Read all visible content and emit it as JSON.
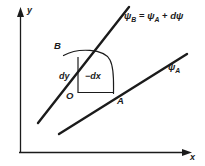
{
  "figure": {
    "type": "diagram",
    "background_color": "#ffffff",
    "line_color": "#1b1b1b",
    "text_color": "#1b1b1b",
    "axes": {
      "y_label": "y",
      "x_label": "x",
      "y_axis": {
        "x": 20,
        "y_top": 10,
        "y_bottom": 152,
        "arrow": "up"
      },
      "x_axis": {
        "y": 152,
        "x_left": 18,
        "x_right": 190,
        "arrow": "right"
      }
    },
    "curves": [
      {
        "name": "psi-B-streamline",
        "label": "ψ",
        "label_sub": "B",
        "equation_label": "ψ_B = ψ_A + dψ",
        "slope": "steep",
        "points": [
          [
            38,
            122
          ],
          [
            128,
            8
          ]
        ]
      },
      {
        "name": "psi-A-streamline",
        "label": "ψ",
        "label_sub": "A",
        "slope": "shallow",
        "points": [
          [
            60,
            133
          ],
          [
            186,
            55
          ]
        ]
      }
    ],
    "equation": {
      "lhs_symbol": "ψ",
      "lhs_sub": "B",
      "operator_equals": "=",
      "rhs_symbol": "ψ",
      "rhs_sub": "A",
      "operator_plus": "+",
      "differential": "dψ",
      "full_text": "ψB = ψA + dψ"
    },
    "psi_a_label": {
      "symbol": "ψ",
      "sub": "A"
    },
    "points": [
      {
        "name": "point-B",
        "label": "B",
        "x": 62,
        "y": 55
      },
      {
        "name": "point-A",
        "label": "A",
        "x": 113,
        "y": 95
      },
      {
        "name": "point-O",
        "label": "O",
        "x": 71,
        "y": 95
      }
    ],
    "differentials": [
      {
        "name": "dy-label",
        "text": "dy",
        "x": 59,
        "y": 72
      },
      {
        "name": "dx-label",
        "text": "−dx",
        "x": 85,
        "y": 72
      }
    ],
    "element": {
      "vertical_segment": {
        "name": "dy-segment",
        "from": [
          78,
          57
        ],
        "to": [
          78,
          92
        ]
      },
      "horizontal_segment": {
        "name": "dx-segment",
        "from": [
          78,
          92
        ],
        "to": [
          112,
          92
        ]
      },
      "arc": {
        "name": "b-to-a-arc",
        "from": [
          63,
          55
        ],
        "to": [
          113,
          94
        ]
      }
    }
  }
}
